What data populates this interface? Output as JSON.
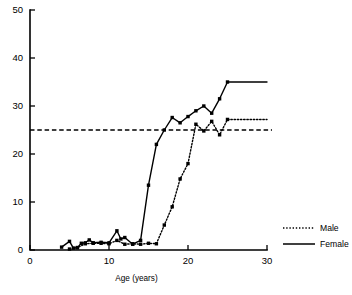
{
  "chart_data": {
    "type": "line",
    "title": "",
    "xlabel": "Age (years)",
    "ylabel": "",
    "xlim": [
      0,
      30
    ],
    "ylim": [
      0,
      50
    ],
    "xticks": [
      0,
      10,
      20,
      30
    ],
    "xtick_labels": [
      "0",
      "10",
      "20",
      "30"
    ],
    "yticks": [
      0,
      10,
      20,
      30,
      40,
      50
    ],
    "ytick_labels": [
      "0",
      "10",
      "20",
      "30",
      "40",
      "50"
    ],
    "grid": false,
    "legend_position": "right",
    "legend": [
      {
        "name": "Male",
        "style": "dotted",
        "marker": "square"
      },
      {
        "name": "Female",
        "style": "solid",
        "marker": "square"
      }
    ],
    "annotations": [
      {
        "type": "hline",
        "value": 25,
        "style": "dashed",
        "label": ""
      }
    ],
    "series": [
      {
        "name": "Female",
        "style": "solid",
        "marker": "square",
        "x": [
          4,
          5,
          5.5,
          6,
          6.5,
          7,
          7.5,
          8,
          9,
          10,
          11,
          11.5,
          12,
          13,
          14,
          15,
          16,
          17,
          18,
          19,
          20,
          21,
          22,
          23,
          24,
          25,
          30
        ],
        "y": [
          0.6,
          1.8,
          0.4,
          0.5,
          1.4,
          1.5,
          2.1,
          1.5,
          1.6,
          1.5,
          4.0,
          2.3,
          2.6,
          1.2,
          2.0,
          13.5,
          22.0,
          25.0,
          27.6,
          26.5,
          27.8,
          29.0,
          30.0,
          28.5,
          31.5,
          35.0,
          35.0
        ]
      },
      {
        "name": "Male",
        "style": "dotted",
        "marker": "square",
        "x": [
          5,
          6,
          7,
          8,
          9,
          10,
          11,
          12,
          13,
          14,
          15,
          16,
          17,
          18,
          19,
          20,
          21,
          22,
          23,
          24,
          25,
          30
        ],
        "y": [
          0.2,
          0.5,
          1.3,
          1.4,
          1.4,
          1.3,
          2.0,
          1.2,
          1.3,
          1.2,
          1.4,
          1.3,
          5.2,
          9.0,
          14.8,
          18.0,
          26.2,
          24.8,
          26.8,
          24.0,
          27.2,
          27.2
        ]
      }
    ]
  }
}
